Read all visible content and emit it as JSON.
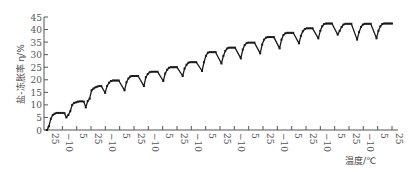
{
  "chart_data": {
    "type": "line",
    "title": "",
    "xlabel": "温度/℃",
    "ylabel": "盐-冻胀率 η/%",
    "ylim": [
      0,
      45
    ],
    "yticks": [
      0,
      5,
      10,
      15,
      20,
      25,
      30,
      35,
      40,
      45
    ],
    "xtick_labels": [
      "25",
      "−10",
      "5",
      "25",
      "−10",
      "5",
      "25",
      "−10",
      "5",
      "25",
      "−10",
      "5",
      "25",
      "−10",
      "5",
      "25",
      "−10",
      "5",
      "25",
      "−10",
      "5",
      "25",
      "−10",
      "5",
      "25"
    ],
    "grid": false,
    "legend": null,
    "series": [
      {
        "name": "盐-冻胀率",
        "marker": "square",
        "points": [
          [
            0.0,
            0.0
          ],
          [
            0.3,
            1.5
          ],
          [
            0.6,
            4.5
          ],
          [
            0.9,
            6.0
          ],
          [
            1.2,
            6.5
          ],
          [
            1.5,
            6.8
          ],
          [
            1.8,
            6.8
          ],
          [
            2.1,
            6.8
          ],
          [
            2.4,
            6.8
          ],
          [
            2.7,
            6.7
          ],
          [
            3.0,
            5.0
          ],
          [
            3.3,
            6.0
          ],
          [
            3.6,
            7.5
          ],
          [
            3.9,
            10.0
          ],
          [
            4.2,
            10.8
          ],
          [
            4.5,
            11.0
          ],
          [
            4.8,
            11.3
          ],
          [
            5.1,
            11.4
          ],
          [
            5.4,
            11.4
          ],
          [
            5.7,
            11.3
          ],
          [
            6.0,
            9.0
          ],
          [
            6.3,
            11.5
          ],
          [
            6.6,
            12.5
          ],
          [
            6.9,
            15.8
          ],
          [
            7.2,
            16.5
          ],
          [
            7.5,
            17.0
          ],
          [
            7.8,
            17.3
          ],
          [
            8.1,
            17.5
          ],
          [
            8.4,
            17.5
          ],
          [
            9.0,
            14.8
          ],
          [
            9.3,
            17.5
          ],
          [
            9.6,
            18.8
          ],
          [
            9.9,
            19.5
          ],
          [
            10.2,
            19.7
          ],
          [
            10.5,
            19.7
          ],
          [
            10.8,
            19.7
          ],
          [
            11.1,
            19.7
          ],
          [
            12.0,
            15.8
          ],
          [
            12.3,
            19.0
          ],
          [
            12.6,
            20.5
          ],
          [
            12.9,
            21.3
          ],
          [
            13.2,
            21.5
          ],
          [
            13.5,
            21.5
          ],
          [
            13.8,
            21.5
          ],
          [
            14.1,
            21.5
          ],
          [
            15.0,
            17.5
          ],
          [
            15.3,
            21.0
          ],
          [
            15.6,
            22.3
          ],
          [
            15.9,
            23.0
          ],
          [
            16.2,
            23.2
          ],
          [
            16.5,
            23.2
          ],
          [
            16.8,
            23.2
          ],
          [
            17.1,
            23.2
          ],
          [
            18.0,
            19.5
          ],
          [
            18.3,
            22.5
          ],
          [
            18.6,
            24.0
          ],
          [
            18.9,
            24.8
          ],
          [
            19.2,
            25.0
          ],
          [
            19.5,
            25.0
          ],
          [
            19.8,
            25.0
          ],
          [
            20.1,
            25.0
          ],
          [
            21.0,
            21.5
          ],
          [
            21.3,
            24.5
          ],
          [
            21.6,
            26.0
          ],
          [
            21.9,
            26.8
          ],
          [
            22.2,
            27.0
          ],
          [
            22.5,
            27.0
          ],
          [
            22.8,
            27.0
          ],
          [
            23.1,
            27.0
          ],
          [
            24.0,
            23.5
          ],
          [
            24.3,
            27.0
          ],
          [
            24.6,
            29.5
          ],
          [
            24.9,
            30.8
          ],
          [
            25.2,
            31.0
          ],
          [
            25.5,
            31.0
          ],
          [
            25.8,
            31.0
          ],
          [
            26.1,
            31.0
          ],
          [
            27.0,
            26.5
          ],
          [
            27.3,
            29.5
          ],
          [
            27.6,
            31.5
          ],
          [
            27.9,
            32.5
          ],
          [
            28.2,
            32.8
          ],
          [
            28.5,
            32.8
          ],
          [
            28.8,
            32.8
          ],
          [
            29.1,
            32.8
          ],
          [
            30.0,
            28.5
          ],
          [
            30.3,
            32.0
          ],
          [
            30.6,
            33.8
          ],
          [
            30.9,
            34.6
          ],
          [
            31.2,
            34.8
          ],
          [
            31.5,
            34.8
          ],
          [
            31.8,
            34.8
          ],
          [
            32.1,
            34.8
          ],
          [
            33.0,
            30.5
          ],
          [
            33.3,
            34.0
          ],
          [
            33.6,
            36.0
          ],
          [
            33.9,
            36.8
          ],
          [
            34.2,
            37.0
          ],
          [
            34.5,
            37.0
          ],
          [
            34.8,
            37.0
          ],
          [
            35.1,
            37.0
          ],
          [
            36.0,
            32.5
          ],
          [
            36.3,
            36.0
          ],
          [
            36.6,
            37.8
          ],
          [
            36.9,
            38.5
          ],
          [
            37.2,
            38.7
          ],
          [
            37.5,
            38.7
          ],
          [
            37.8,
            38.7
          ],
          [
            38.1,
            38.7
          ],
          [
            39.0,
            34.5
          ],
          [
            39.3,
            37.5
          ],
          [
            39.6,
            39.3
          ],
          [
            39.9,
            40.2
          ],
          [
            40.2,
            40.5
          ],
          [
            40.5,
            40.5
          ],
          [
            40.8,
            40.5
          ],
          [
            41.1,
            40.5
          ],
          [
            42.0,
            36.5
          ],
          [
            42.3,
            39.5
          ],
          [
            42.6,
            41.3
          ],
          [
            42.9,
            42.2
          ],
          [
            43.2,
            42.4
          ],
          [
            43.5,
            42.4
          ],
          [
            43.8,
            42.4
          ],
          [
            44.1,
            42.4
          ],
          [
            45.0,
            38.0
          ],
          [
            45.3,
            39.5
          ],
          [
            45.6,
            41.0
          ],
          [
            45.9,
            42.0
          ],
          [
            46.2,
            42.3
          ],
          [
            46.5,
            42.3
          ],
          [
            46.8,
            42.3
          ],
          [
            47.1,
            42.3
          ],
          [
            48.0,
            36.0
          ],
          [
            48.3,
            39.0
          ],
          [
            48.6,
            41.0
          ],
          [
            48.9,
            42.0
          ],
          [
            49.2,
            42.3
          ],
          [
            49.5,
            42.3
          ],
          [
            49.8,
            42.3
          ],
          [
            50.1,
            42.3
          ],
          [
            51.0,
            36.5
          ],
          [
            51.3,
            39.5
          ],
          [
            51.6,
            41.3
          ],
          [
            51.9,
            42.2
          ],
          [
            52.2,
            42.4
          ],
          [
            52.5,
            42.4
          ],
          [
            52.8,
            42.4
          ],
          [
            53.1,
            42.4
          ],
          [
            53.4,
            42.4
          ]
        ]
      }
    ]
  },
  "colors": {
    "line": "#1a1a1a",
    "axis": "#555555",
    "text": "#555555"
  }
}
